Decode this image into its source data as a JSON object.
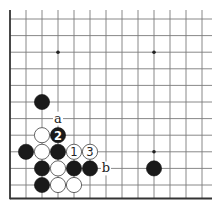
{
  "diagram": {
    "type": "go-board-fragment",
    "grid": {
      "origin_x": 10,
      "origin_y": 19,
      "step_x": 16,
      "step_y": 16.6,
      "columns": 13,
      "rows": 11,
      "edges": {
        "left": true,
        "bottom": true,
        "top": false,
        "right": false
      },
      "line_color": "#7a7a7a",
      "edge_color": "#333333"
    },
    "star_points": [
      {
        "c": 3,
        "r": 2
      },
      {
        "c": 9,
        "r": 2
      },
      {
        "c": 9,
        "r": 8
      }
    ],
    "stones": [
      {
        "color": "black",
        "c": 2,
        "r": 5,
        "label": ""
      },
      {
        "color": "white",
        "c": 2,
        "r": 7,
        "label": ""
      },
      {
        "color": "black",
        "c": 3,
        "r": 7,
        "label": "2"
      },
      {
        "color": "black",
        "c": 1,
        "r": 8,
        "label": ""
      },
      {
        "color": "white",
        "c": 2,
        "r": 8,
        "label": ""
      },
      {
        "color": "black",
        "c": 3,
        "r": 8,
        "label": ""
      },
      {
        "color": "white",
        "c": 4,
        "r": 8,
        "label": "1"
      },
      {
        "color": "white",
        "c": 5,
        "r": 8,
        "label": "3"
      },
      {
        "color": "black",
        "c": 2,
        "r": 9,
        "label": ""
      },
      {
        "color": "white",
        "c": 3,
        "r": 9,
        "label": ""
      },
      {
        "color": "black",
        "c": 4,
        "r": 9,
        "label": ""
      },
      {
        "color": "black",
        "c": 5,
        "r": 9,
        "label": ""
      },
      {
        "color": "black",
        "c": 9,
        "r": 9,
        "label": ""
      },
      {
        "color": "black",
        "c": 2,
        "r": 10,
        "label": ""
      },
      {
        "color": "white",
        "c": 3,
        "r": 10,
        "label": ""
      },
      {
        "color": "white",
        "c": 4,
        "r": 10,
        "label": ""
      }
    ],
    "point_labels": [
      {
        "text": "a",
        "c": 3,
        "r": 6
      },
      {
        "text": "b",
        "c": 6,
        "r": 9
      }
    ]
  }
}
